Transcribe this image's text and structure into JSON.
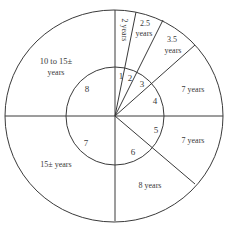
{
  "diagram": {
    "type": "concentric-pie",
    "inner_segments": [
      {
        "number": "1"
      },
      {
        "number": "2"
      },
      {
        "number": "3"
      },
      {
        "number": "4"
      },
      {
        "number": "5"
      },
      {
        "number": "6"
      },
      {
        "number": "7"
      },
      {
        "number": "8"
      }
    ],
    "outer_segments": [
      {
        "label": "2 years"
      },
      {
        "label_line1": "2.5",
        "label_line2": "years"
      },
      {
        "label_line1": "3.5",
        "label_line2": "years"
      },
      {
        "label": "7 years"
      },
      {
        "label": "7 years"
      },
      {
        "label": "8 years"
      },
      {
        "label": "15± years"
      },
      {
        "label_line1": "10 to 15±",
        "label_line2": "years"
      }
    ],
    "colors": {
      "stroke": "#3a3a3a",
      "background": "#ffffff"
    }
  }
}
